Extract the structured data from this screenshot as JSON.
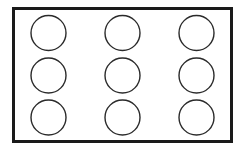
{
  "diagram": {
    "frame": {
      "x": 13.5,
      "y": 8.5,
      "width": 218,
      "height": 133,
      "stroke": "#1a1a1a",
      "stroke_width": 3,
      "fill": "#ffffff"
    },
    "circle_style": {
      "r": 17.5,
      "stroke": "#2a2a2a",
      "stroke_width": 1.4,
      "fill": "none"
    },
    "grid": {
      "rows": 3,
      "cols": 3,
      "col_centers": [
        48.5,
        122.5,
        196.5
      ],
      "row_centers": [
        33,
        75.5,
        117.5
      ]
    }
  }
}
